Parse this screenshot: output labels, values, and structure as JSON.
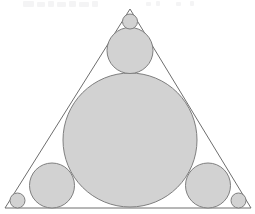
{
  "figure": {
    "canvas": {
      "width": 255,
      "height": 214
    },
    "background_color": "#ffffff",
    "shape_fill_color": "#d2d2d2",
    "shape_stroke_color": "#7f7f7f",
    "triangle_stroke_color": "#6e6e6e",
    "stroke_width": 1
  },
  "chart_data": {
    "type": "diagram",
    "xlabel": "",
    "ylabel": "",
    "xlim": [
      0,
      255
    ],
    "ylim": [
      0,
      214
    ],
    "grid": false,
    "legend": "none",
    "triangle": {
      "name": "outer-triangle",
      "vertices": [
        {
          "label": "apex",
          "x": 130,
          "y": 9
        },
        {
          "label": "bottom-left",
          "x": 5,
          "y": 208
        },
        {
          "label": "bottom-right",
          "x": 251,
          "y": 208
        }
      ],
      "fill": "none",
      "stroke": "#6e6e6e"
    },
    "circles": [
      {
        "name": "incircle",
        "role": "large-inscribed-circle",
        "cx": 130,
        "cy": 140,
        "r": 67,
        "fill": "#d2d2d2",
        "stroke": "#7f7f7f"
      },
      {
        "name": "medium-circle-top",
        "role": "medium-circle",
        "cx": 130,
        "cy": 50.5,
        "r": 23,
        "fill": "#d2d2d2",
        "stroke": "#7f7f7f"
      },
      {
        "name": "medium-circle-bottom-left",
        "role": "medium-circle",
        "cx": 52,
        "cy": 185.5,
        "r": 22.5,
        "fill": "#d2d2d2",
        "stroke": "#7f7f7f"
      },
      {
        "name": "medium-circle-bottom-right",
        "role": "medium-circle",
        "cx": 208,
        "cy": 185.5,
        "r": 22.5,
        "fill": "#d2d2d2",
        "stroke": "#7f7f7f"
      },
      {
        "name": "small-circle-apex",
        "role": "corner-circle",
        "cx": 130,
        "cy": 21.5,
        "r": 7.5,
        "fill": "#d2d2d2",
        "stroke": "#7f7f7f"
      },
      {
        "name": "small-circle-bottom-left",
        "role": "corner-circle",
        "cx": 17.5,
        "cy": 200.5,
        "r": 7.5,
        "fill": "#d2d2d2",
        "stroke": "#7f7f7f"
      },
      {
        "name": "small-circle-bottom-right",
        "role": "corner-circle",
        "cx": 238.5,
        "cy": 200.5,
        "r": 7.5,
        "fill": "#d2d2d2",
        "stroke": "#7f7f7f"
      }
    ],
    "counts": {
      "triangles": 1,
      "large_circles": 1,
      "medium_circles": 3,
      "small_circles": 3,
      "total_circles": 7
    }
  },
  "artifacts": {
    "note": "faint light-gray scanning marks along the very top edge",
    "color": "#f4f4f5",
    "marks": [
      {
        "x": 23,
        "y": 1,
        "w": 11,
        "h": 6
      },
      {
        "x": 37,
        "y": 2,
        "w": 8,
        "h": 5
      },
      {
        "x": 48,
        "y": 1,
        "w": 6,
        "h": 6
      },
      {
        "x": 57,
        "y": 2,
        "w": 9,
        "h": 5
      },
      {
        "x": 69,
        "y": 1,
        "w": 7,
        "h": 6
      },
      {
        "x": 79,
        "y": 2,
        "w": 10,
        "h": 5
      },
      {
        "x": 92,
        "y": 1,
        "w": 6,
        "h": 6
      },
      {
        "x": 146,
        "y": 2,
        "w": 5,
        "h": 4
      },
      {
        "x": 156,
        "y": 1,
        "w": 4,
        "h": 5
      },
      {
        "x": 176,
        "y": 2,
        "w": 5,
        "h": 4
      },
      {
        "x": 190,
        "y": 1,
        "w": 4,
        "h": 5
      }
    ]
  }
}
